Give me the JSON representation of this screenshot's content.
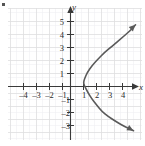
{
  "figure": {
    "title": "",
    "corner_mark": "bullet"
  },
  "axes": {
    "x_axis_label": "x",
    "y_axis_label": "y",
    "x_ticks": [
      {
        "value": -4,
        "label": "–4"
      },
      {
        "value": -3,
        "label": "–3"
      },
      {
        "value": -2,
        "label": "–2"
      },
      {
        "value": -1,
        "label": "–1"
      },
      {
        "value": 1,
        "label": "1"
      },
      {
        "value": 2,
        "label": "2"
      },
      {
        "value": 3,
        "label": "3"
      },
      {
        "value": 4,
        "label": "4"
      }
    ],
    "y_ticks": [
      {
        "value": 5,
        "label": "5"
      },
      {
        "value": 4,
        "label": "4"
      },
      {
        "value": 3,
        "label": "3"
      },
      {
        "value": 2,
        "label": "2"
      },
      {
        "value": 1,
        "label": "1"
      },
      {
        "value": -1,
        "label": "–1"
      },
      {
        "value": -2,
        "label": "–2"
      },
      {
        "value": -3,
        "label": "–3"
      }
    ],
    "colors": {
      "axis": "#3a3a3a",
      "grid": "#e2e2e6",
      "curve": "#5a5a5a",
      "text": "#2b2b2b",
      "background": "#ffffff"
    }
  },
  "chart_data": {
    "type": "line",
    "title": "",
    "xlabel": "x",
    "ylabel": "y",
    "xlim": [
      -5,
      5
    ],
    "ylim": [
      -3.8,
      5.8
    ],
    "grid": true,
    "legend": "none",
    "series": [
      {
        "name": "rightward-parabola",
        "equation": "x = (y - 0.3)^2 + 1",
        "arrows": [
          "start",
          "end"
        ],
        "points": [
          {
            "x": 4.85,
            "y": -3.4
          },
          {
            "x": 4.2,
            "y": -3.1
          },
          {
            "x": 3.5,
            "y": -2.7
          },
          {
            "x": 2.9,
            "y": -2.3
          },
          {
            "x": 2.4,
            "y": -1.9
          },
          {
            "x": 2.0,
            "y": -1.4
          },
          {
            "x": 1.6,
            "y": -0.9
          },
          {
            "x": 1.3,
            "y": -0.4
          },
          {
            "x": 1.05,
            "y": 0.1
          },
          {
            "x": 1.0,
            "y": 0.3
          },
          {
            "x": 1.08,
            "y": 0.6
          },
          {
            "x": 1.3,
            "y": 1.1
          },
          {
            "x": 1.65,
            "y": 1.6
          },
          {
            "x": 2.1,
            "y": 2.1
          },
          {
            "x": 2.6,
            "y": 2.6
          },
          {
            "x": 3.2,
            "y": 3.1
          },
          {
            "x": 3.9,
            "y": 3.7
          },
          {
            "x": 4.6,
            "y": 4.3
          },
          {
            "x": 5.0,
            "y": 4.75
          }
        ]
      }
    ]
  }
}
